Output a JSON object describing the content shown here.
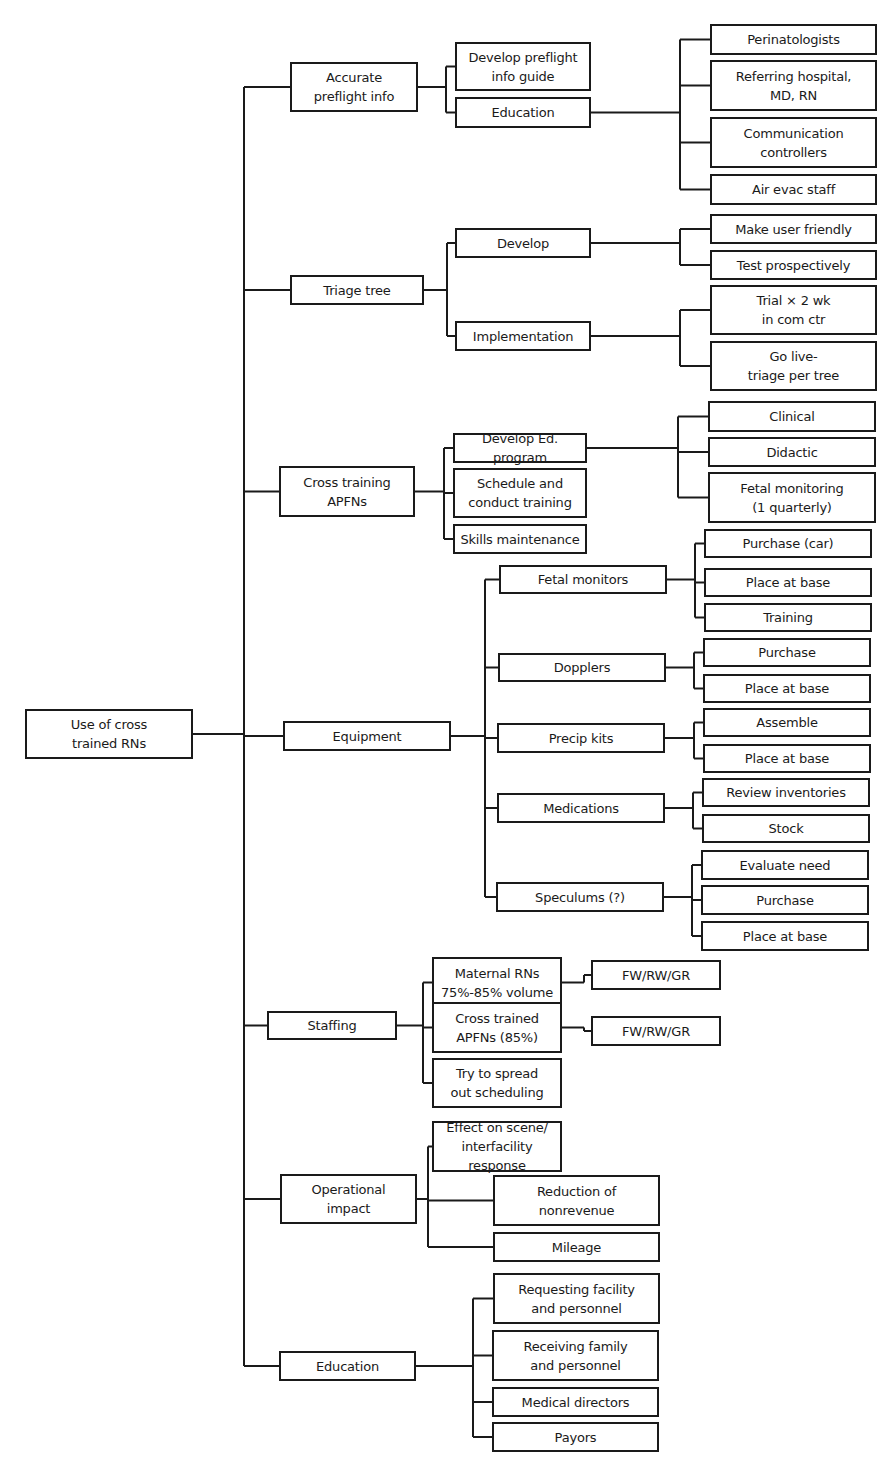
{
  "diagram": {
    "type": "tree",
    "root": "Use of cross\ntrained RNs",
    "colors": {
      "stroke": "#1a1a1a",
      "background": "#ffffff",
      "text": "#1a1a1a"
    }
  },
  "nodes": [
    {
      "id": "root",
      "label": "Use of cross\ntrained RNs",
      "x": 25,
      "y": 709,
      "w": 168,
      "h": 50
    },
    {
      "id": "n1",
      "label": "Accurate\npreflight info",
      "x": 290,
      "y": 62,
      "w": 128,
      "h": 50
    },
    {
      "id": "n1a",
      "label": "Develop preflight\ninfo guide",
      "x": 455,
      "y": 42,
      "w": 136,
      "h": 49
    },
    {
      "id": "n1b",
      "label": "Education",
      "x": 455,
      "y": 97,
      "w": 136,
      "h": 31
    },
    {
      "id": "n1b1",
      "label": "Perinatologists",
      "x": 710,
      "y": 24,
      "w": 167,
      "h": 31
    },
    {
      "id": "n1b2",
      "label": "Referring hospital,\nMD, RN",
      "x": 710,
      "y": 60,
      "w": 167,
      "h": 51
    },
    {
      "id": "n1b3",
      "label": "Communication\ncontrollers",
      "x": 710,
      "y": 117,
      "w": 167,
      "h": 51
    },
    {
      "id": "n1b4",
      "label": "Air evac staff",
      "x": 710,
      "y": 174,
      "w": 167,
      "h": 31
    },
    {
      "id": "n2",
      "label": "Triage tree",
      "x": 290,
      "y": 275,
      "w": 134,
      "h": 30
    },
    {
      "id": "n2a",
      "label": "Develop",
      "x": 455,
      "y": 228,
      "w": 136,
      "h": 30
    },
    {
      "id": "n2b",
      "label": "Implementation",
      "x": 455,
      "y": 321,
      "w": 136,
      "h": 30
    },
    {
      "id": "n2a1",
      "label": "Make user friendly",
      "x": 710,
      "y": 214,
      "w": 167,
      "h": 30
    },
    {
      "id": "n2a2",
      "label": "Test prospectively",
      "x": 710,
      "y": 250,
      "w": 167,
      "h": 30
    },
    {
      "id": "n2b1",
      "label": "Trial × 2 wk\nin com ctr",
      "x": 710,
      "y": 285,
      "w": 167,
      "h": 50
    },
    {
      "id": "n2b2",
      "label": "Go live-\ntriage per tree",
      "x": 710,
      "y": 341,
      "w": 167,
      "h": 50
    },
    {
      "id": "n3",
      "label": "Cross training\nAPFNs",
      "x": 279,
      "y": 466,
      "w": 136,
      "h": 51
    },
    {
      "id": "n3a",
      "label": "Develop Ed. program",
      "x": 453,
      "y": 433,
      "w": 134,
      "h": 30
    },
    {
      "id": "n3b",
      "label": "Schedule and\nconduct training",
      "x": 453,
      "y": 468,
      "w": 134,
      "h": 50
    },
    {
      "id": "n3c",
      "label": "Skills maintenance",
      "x": 453,
      "y": 524,
      "w": 134,
      "h": 30
    },
    {
      "id": "n3a1",
      "label": "Clinical",
      "x": 708,
      "y": 401,
      "w": 168,
      "h": 31
    },
    {
      "id": "n3a2",
      "label": "Didactic",
      "x": 708,
      "y": 437,
      "w": 168,
      "h": 30
    },
    {
      "id": "n3a3",
      "label": "Fetal monitoring\n(1 quarterly)",
      "x": 708,
      "y": 472,
      "w": 168,
      "h": 51
    },
    {
      "id": "n4",
      "label": "Equipment",
      "x": 283,
      "y": 721,
      "w": 168,
      "h": 30
    },
    {
      "id": "n4a",
      "label": "Fetal monitors",
      "x": 499,
      "y": 565,
      "w": 168,
      "h": 29
    },
    {
      "id": "n4b",
      "label": "Dopplers",
      "x": 498,
      "y": 653,
      "w": 168,
      "h": 29
    },
    {
      "id": "n4c",
      "label": "Precip kits",
      "x": 497,
      "y": 723,
      "w": 168,
      "h": 30
    },
    {
      "id": "n4d",
      "label": "Medications",
      "x": 497,
      "y": 793,
      "w": 168,
      "h": 30
    },
    {
      "id": "n4e",
      "label": "Speculums (?)",
      "x": 496,
      "y": 882,
      "w": 168,
      "h": 30
    },
    {
      "id": "n4a1",
      "label": "Purchase (car)",
      "x": 704,
      "y": 529,
      "w": 168,
      "h": 29
    },
    {
      "id": "n4a2",
      "label": "Place at base",
      "x": 704,
      "y": 568,
      "w": 168,
      "h": 29
    },
    {
      "id": "n4a3",
      "label": "Training",
      "x": 704,
      "y": 603,
      "w": 168,
      "h": 29
    },
    {
      "id": "n4b1",
      "label": "Purchase",
      "x": 703,
      "y": 638,
      "w": 168,
      "h": 29
    },
    {
      "id": "n4b2",
      "label": "Place at base",
      "x": 703,
      "y": 674,
      "w": 168,
      "h": 29
    },
    {
      "id": "n4c1",
      "label": "Assemble",
      "x": 703,
      "y": 708,
      "w": 168,
      "h": 29
    },
    {
      "id": "n4c2",
      "label": "Place at base",
      "x": 703,
      "y": 744,
      "w": 168,
      "h": 29
    },
    {
      "id": "n4d1",
      "label": "Review inventories",
      "x": 702,
      "y": 778,
      "w": 168,
      "h": 29
    },
    {
      "id": "n4d2",
      "label": "Stock",
      "x": 702,
      "y": 814,
      "w": 168,
      "h": 29
    },
    {
      "id": "n4e1",
      "label": "Evaluate need",
      "x": 701,
      "y": 850,
      "w": 168,
      "h": 30
    },
    {
      "id": "n4e2",
      "label": "Purchase",
      "x": 701,
      "y": 885,
      "w": 168,
      "h": 30
    },
    {
      "id": "n4e3",
      "label": "Place at base",
      "x": 701,
      "y": 921,
      "w": 168,
      "h": 30
    },
    {
      "id": "n5",
      "label": "Staffing",
      "x": 267,
      "y": 1011,
      "w": 130,
      "h": 29
    },
    {
      "id": "n5a",
      "label": "Maternal RNs\n75%-85% volume",
      "x": 432,
      "y": 957,
      "w": 130,
      "h": 51
    },
    {
      "id": "n5b",
      "label": "Cross trained\nAPFNs (85%)",
      "x": 432,
      "y": 1002,
      "w": 130,
      "h": 51
    },
    {
      "id": "n5c",
      "label": "Try to spread\nout scheduling",
      "x": 432,
      "y": 1058,
      "w": 130,
      "h": 50
    },
    {
      "id": "n5a1",
      "label": "FW/RW/GR",
      "x": 591,
      "y": 960,
      "w": 130,
      "h": 30
    },
    {
      "id": "n5b1",
      "label": "FW/RW/GR",
      "x": 591,
      "y": 1016,
      "w": 130,
      "h": 30
    },
    {
      "id": "n6",
      "label": "Operational\nimpact",
      "x": 280,
      "y": 1174,
      "w": 137,
      "h": 50
    },
    {
      "id": "n6a",
      "label": "Effect on scene/\ninterfacility response",
      "x": 432,
      "y": 1121,
      "w": 130,
      "h": 51
    },
    {
      "id": "n6b",
      "label": "Reduction of\nnonrevenue",
      "x": 493,
      "y": 1175,
      "w": 167,
      "h": 51
    },
    {
      "id": "n6c",
      "label": "Mileage",
      "x": 493,
      "y": 1232,
      "w": 167,
      "h": 30
    },
    {
      "id": "n7",
      "label": "Education",
      "x": 279,
      "y": 1351,
      "w": 137,
      "h": 30
    },
    {
      "id": "n7a",
      "label": "Requesting facility\nand personnel",
      "x": 493,
      "y": 1273,
      "w": 167,
      "h": 51
    },
    {
      "id": "n7b",
      "label": "Receiving family\nand personnel",
      "x": 492,
      "y": 1330,
      "w": 167,
      "h": 51
    },
    {
      "id": "n7c",
      "label": "Medical directors",
      "x": 492,
      "y": 1387,
      "w": 167,
      "h": 30
    },
    {
      "id": "n7d",
      "label": "Payors",
      "x": 492,
      "y": 1422,
      "w": 167,
      "h": 30
    }
  ],
  "edges": [
    [
      "root",
      [
        "n1",
        "n2",
        "n3",
        "n4",
        "n5",
        "n6",
        "n7"
      ]
    ],
    [
      "n1",
      [
        "n1a",
        "n1b"
      ]
    ],
    [
      "n1b",
      [
        "n1b1",
        "n1b2",
        "n1b3",
        "n1b4"
      ]
    ],
    [
      "n2",
      [
        "n2a",
        "n2b"
      ]
    ],
    [
      "n2a",
      [
        "n2a1",
        "n2a2"
      ]
    ],
    [
      "n2b",
      [
        "n2b1",
        "n2b2"
      ]
    ],
    [
      "n3",
      [
        "n3a",
        "n3b",
        "n3c"
      ]
    ],
    [
      "n3a",
      [
        "n3a1",
        "n3a2",
        "n3a3"
      ]
    ],
    [
      "n4",
      [
        "n4a",
        "n4b",
        "n4c",
        "n4d",
        "n4e"
      ]
    ],
    [
      "n4a",
      [
        "n4a1",
        "n4a2",
        "n4a3"
      ]
    ],
    [
      "n4b",
      [
        "n4b1",
        "n4b2"
      ]
    ],
    [
      "n4c",
      [
        "n4c1",
        "n4c2"
      ]
    ],
    [
      "n4d",
      [
        "n4d1",
        "n4d2"
      ]
    ],
    [
      "n4e",
      [
        "n4e1",
        "n4e2",
        "n4e3"
      ]
    ],
    [
      "n5",
      [
        "n5a",
        "n5b",
        "n5c"
      ]
    ],
    [
      "n5a",
      [
        "n5a1"
      ]
    ],
    [
      "n5b",
      [
        "n5b1"
      ]
    ],
    [
      "n6",
      [
        "n6a",
        "n6b",
        "n6c"
      ]
    ],
    [
      "n7",
      [
        "n7a",
        "n7b",
        "n7c",
        "n7d"
      ]
    ]
  ]
}
